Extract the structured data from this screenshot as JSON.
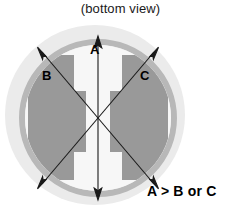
{
  "figure": {
    "title": "(bottom view)",
    "relation_note": "A > B or C",
    "labels": {
      "a": "A",
      "b": "B",
      "c": "C"
    },
    "colors": {
      "outer_disc": "#ebebeb",
      "ring": "#b8b8b8",
      "inner_face": "#f7f7f7",
      "block": "#999999",
      "arrow": "#1a1a1a",
      "text": "#000000",
      "background": "#ffffff"
    },
    "geometry": {
      "outer_disc_center_x": 95,
      "outer_disc_center_y": 115,
      "outer_disc_radius": 90,
      "ring_center_x": 98,
      "ring_center_y": 118,
      "ring_outer_radius": 79,
      "ring_inner_radius": 73,
      "intersection_x": 98,
      "intersection_y": 118
    },
    "dimensions": [
      {
        "id": "a",
        "label": "A",
        "orientation": "vertical",
        "from_x": 98,
        "from_y": 39,
        "to_x": 98,
        "to_y": 197,
        "arrowheads": "both"
      },
      {
        "id": "b",
        "label": "B",
        "orientation": "diagonal-nwse",
        "from_x": 40,
        "from_y": 50,
        "to_x": 156,
        "to_y": 186,
        "arrowheads": "both"
      },
      {
        "id": "c",
        "label": "C",
        "orientation": "diagonal-nesw",
        "from_x": 156,
        "from_y": 50,
        "to_x": 40,
        "to_y": 186,
        "arrowheads": "both"
      }
    ],
    "blocks": [
      {
        "id": "left-block",
        "side": "left",
        "shape": "stepped-notched"
      },
      {
        "id": "right-block",
        "side": "right",
        "shape": "stepped-notched"
      }
    ]
  }
}
